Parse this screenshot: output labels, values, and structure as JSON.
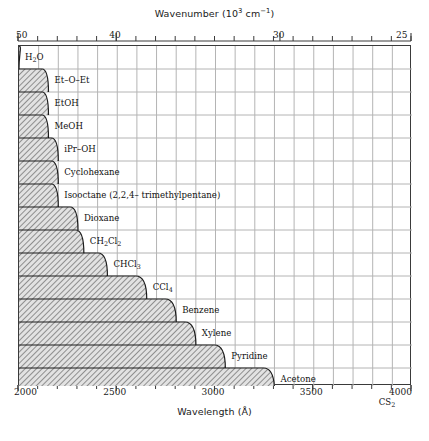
{
  "chart_data": {
    "type": "bar",
    "title": "",
    "xlabel": "Wavelength (Å)",
    "ylabel": "",
    "top_axis_label": "Wavenumber (10³ cm⁻¹)",
    "xlim": [
      2000,
      4000
    ],
    "top_xlim": [
      50,
      25
    ],
    "grid": true,
    "legend": "none",
    "x_ticks": [
      {
        "value": 2000,
        "label": "2000"
      },
      {
        "value": 2500,
        "label": "2500"
      },
      {
        "value": 3000,
        "label": "3000"
      },
      {
        "value": 3500,
        "label": "3500"
      },
      {
        "value": 4000,
        "label": "4000"
      }
    ],
    "top_ticks": [
      {
        "value": 50,
        "label": "50",
        "wavelength": 2000
      },
      {
        "value": 40,
        "label": "40",
        "wavelength": 2500
      },
      {
        "value": 30,
        "label": "30",
        "wavelength": 3333
      },
      {
        "value": 25,
        "label": "25",
        "wavelength": 4000
      }
    ],
    "series_name": "UV cutoff wavelength",
    "categories": [
      "H2O",
      "Et-O-Et",
      "EtOH",
      "MeOH",
      "iPr-OH",
      "Cyclohexane",
      "Isooctane (2,2,4-trimethylpentane)",
      "Dioxane",
      "CH2Cl2",
      "CHCl3",
      "CCl4",
      "Benzene",
      "Xylene",
      "Pyridine",
      "Acetone",
      "CS2"
    ],
    "values": [
      2000,
      2150,
      2150,
      2150,
      2200,
      2200,
      2200,
      2300,
      2330,
      2450,
      2650,
      2800,
      2900,
      3050,
      3300,
      3800
    ],
    "bars": [
      {
        "name": "H2O",
        "label": "H<sub>2</sub>O",
        "cutoff": 2000
      },
      {
        "name": "Et-O-Et",
        "label": "Et–O–Et",
        "cutoff": 2150
      },
      {
        "name": "EtOH",
        "label": "EtOH",
        "cutoff": 2150
      },
      {
        "name": "MeOH",
        "label": "MeOH",
        "cutoff": 2150
      },
      {
        "name": "iPr-OH",
        "label": "iPr–OH",
        "cutoff": 2200
      },
      {
        "name": "Cyclohexane",
        "label": "Cyclohexane",
        "cutoff": 2200
      },
      {
        "name": "Isooctane",
        "label": "Isooctane (2,2,4– trimethylpentane)",
        "cutoff": 2200
      },
      {
        "name": "Dioxane",
        "label": "Dioxane",
        "cutoff": 2300
      },
      {
        "name": "CH2Cl2",
        "label": "CH<sub>2</sub>Cl<sub>2</sub>",
        "cutoff": 2330
      },
      {
        "name": "CHCl3",
        "label": "CHCl<sub>3</sub>",
        "cutoff": 2450
      },
      {
        "name": "CCl4",
        "label": "CCl<sub>4</sub>",
        "cutoff": 2650
      },
      {
        "name": "Benzene",
        "label": "Benzene",
        "cutoff": 2800
      },
      {
        "name": "Xylene",
        "label": "Xylene",
        "cutoff": 2900
      },
      {
        "name": "Pyridine",
        "label": "Pyridine",
        "cutoff": 3050
      },
      {
        "name": "Acetone",
        "label": "Acetone",
        "cutoff": 3300
      },
      {
        "name": "CS2",
        "label": "CS<sub>2</sub>",
        "cutoff": 3800
      }
    ],
    "colors": {
      "hatch_fill": "#c8c8c8",
      "hatch_line": "#8a8a8a",
      "band_edge": "#1a1a1a",
      "grid_line": "#b4b4b4",
      "frame": "#3a3a3a",
      "text": "#1a1a1a",
      "background": "#ffffff"
    }
  }
}
